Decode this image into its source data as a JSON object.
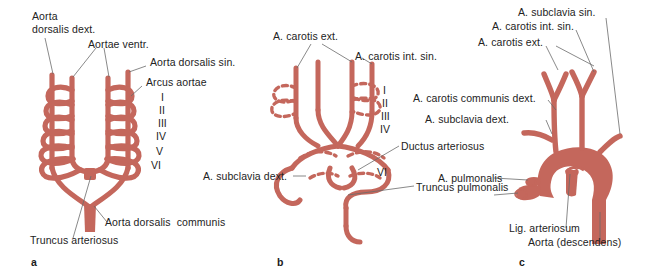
{
  "figure": {
    "background_color": "#ffffff",
    "vessel_color": "#c4675c",
    "vessel_outline_color": "#a8453c",
    "leader_line_color": "#6b6b6b",
    "text_color": "#232323"
  },
  "panels": [
    {
      "letter": "a",
      "name": "embryonic-aortic-arch-system",
      "roman_numerals": [
        "I",
        "II",
        "III",
        "IV",
        "V",
        "VI"
      ],
      "labels": [
        {
          "id": "aorta-dorsalis-dext",
          "text": "Aorta\ndorsalis dext."
        },
        {
          "id": "aortae-ventr",
          "text": "Aortae ventr."
        },
        {
          "id": "aorta-dorsalis-sin",
          "text": "Aorta dorsalis sin."
        },
        {
          "id": "arcus-aortae",
          "text": "Arcus aortae"
        },
        {
          "id": "aorta-dorsalis-communis",
          "text": "Aorta dorsalis  communis"
        },
        {
          "id": "truncus-arteriosus",
          "text": "Truncus arteriosus"
        }
      ]
    },
    {
      "letter": "b",
      "name": "transitional-aortic-arch-system",
      "roman_numerals": [
        "I",
        "II",
        "III",
        "IV",
        "VI"
      ],
      "labels": [
        {
          "id": "a-carotis-ext",
          "text": "A. carotis ext."
        },
        {
          "id": "a-carotis-int-sin",
          "text": "A. carotis int. sin."
        },
        {
          "id": "ductus-arteriosus",
          "text": "Ductus arteriosus"
        },
        {
          "id": "a-subclavia-dext",
          "text": "A. subclavia dext."
        },
        {
          "id": "truncus-pulmonalis",
          "text": "Truncus pulmonalis"
        }
      ]
    },
    {
      "letter": "c",
      "name": "definitive-adult-aortic-arch",
      "roman_numerals": [],
      "labels": [
        {
          "id": "a-subclavia-sin",
          "text": "A. subclavia sin."
        },
        {
          "id": "a-carotis-int-sin-c",
          "text": "A. carotis int. sin."
        },
        {
          "id": "a-carotis-ext-c",
          "text": "A. carotis ext."
        },
        {
          "id": "a-carotis-communis-dext",
          "text": "A. carotis communis dext."
        },
        {
          "id": "a-subclavia-dext-c",
          "text": "A. subclavia dext."
        },
        {
          "id": "a-pulmonalis",
          "text": "A. pulmonalis"
        },
        {
          "id": "lig-arteriosum",
          "text": "Lig. arteriosum"
        },
        {
          "id": "aorta-descendens",
          "text": "Aorta (descendens)"
        }
      ]
    }
  ]
}
